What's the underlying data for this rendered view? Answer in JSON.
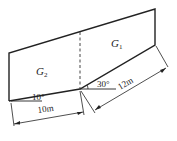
{
  "diagram": {
    "type": "landslide-block-slip-surface",
    "blocks": [
      {
        "name": "G1",
        "label_main": "G",
        "label_sub": "1"
      },
      {
        "name": "G2",
        "label_main": "G",
        "label_sub": "2"
      }
    ],
    "angles": {
      "lower_slip_angle": "10°",
      "upper_slip_angle": "30°"
    },
    "dimensions": {
      "lower_length": "10m",
      "upper_length": "12m"
    },
    "colors": {
      "line": "#222222",
      "background": "#ffffff"
    }
  }
}
